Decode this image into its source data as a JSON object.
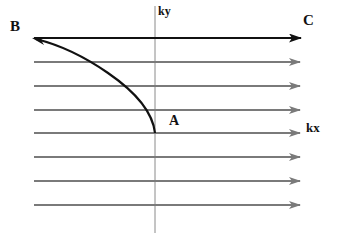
{
  "labels": {
    "B": "B",
    "C": "C",
    "A": "A",
    "ky": "ky",
    "kx": "kx"
  },
  "colors": {
    "highlight_line": "#111111",
    "field_lines": "#7a7a7a",
    "axis": "#8a8a8a",
    "curve": "#111111"
  },
  "diagram": {
    "horizontal_lines_y": [
      38,
      62,
      86,
      110,
      133,
      157,
      181,
      205
    ],
    "vertical_axis_x": 155,
    "curve_from": "A",
    "curve_to": "B",
    "top_line_direction": "B to C"
  }
}
